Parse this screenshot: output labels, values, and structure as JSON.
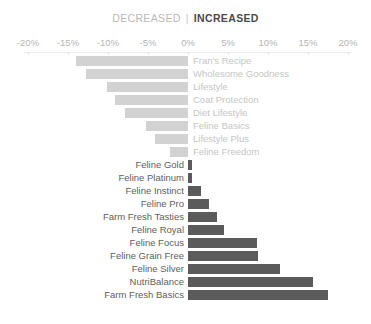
{
  "legend": {
    "decreased_label": "DECREASED",
    "separator": "|",
    "increased_label": "INCREASED"
  },
  "colors": {
    "decreased_bar": "#d2d2d2",
    "increased_bar": "#5b5b5b",
    "decreased_text": "#c6c6c6",
    "increased_text": "#5e5e5e",
    "axis_text": "#b5b5b5",
    "axis_line": "#ededed",
    "background": "#ffffff"
  },
  "chart_data": {
    "type": "bar",
    "orientation": "horizontal",
    "title": "",
    "subtitle": "",
    "xlabel": "",
    "ylabel": "",
    "xlim": [
      -20,
      20
    ],
    "xticks": [
      -20,
      -15,
      -10,
      -5,
      0,
      5,
      10,
      15,
      20
    ],
    "xtick_labels": [
      "-20%",
      "-15%",
      "-10%",
      "-5%",
      "0%",
      "5%",
      "10%",
      "15%",
      "20%"
    ],
    "grid": false,
    "legend_position": "top-center",
    "legend_entries": [
      "DECREASED",
      "INCREASED"
    ],
    "categories": [
      "Fran's Recipe",
      "Wholesome Goodness",
      "Lifestyle",
      "Coat Protection",
      "Diet Lifestyle",
      "Feline Basics",
      "Lifestyle Plus",
      "Feline Freedom",
      "Feline Gold",
      "Feline Platinum",
      "Feline Instinct",
      "Feline Pro",
      "Farm Fresh Tasties",
      "Feline Royal",
      "Feline Focus",
      "Feline Grain Free",
      "Feline Silver",
      "NutriBalance",
      "Farm Fresh Basics"
    ],
    "values": [
      -14.0,
      -12.8,
      -10.1,
      -9.1,
      -7.9,
      -5.3,
      -4.1,
      -2.3,
      0.5,
      0.5,
      1.6,
      2.6,
      3.6,
      4.5,
      8.6,
      8.8,
      11.5,
      15.6,
      17.5
    ],
    "bars": [
      {
        "label": "Fran's Recipe",
        "value": -14.0,
        "direction": "decreased"
      },
      {
        "label": "Wholesome Goodness",
        "value": -12.8,
        "direction": "decreased"
      },
      {
        "label": "Lifestyle",
        "value": -10.1,
        "direction": "decreased"
      },
      {
        "label": "Coat Protection",
        "value": -9.1,
        "direction": "decreased"
      },
      {
        "label": "Diet Lifestyle",
        "value": -7.9,
        "direction": "decreased"
      },
      {
        "label": "Feline Basics",
        "value": -5.3,
        "direction": "decreased"
      },
      {
        "label": "Lifestyle Plus",
        "value": -4.1,
        "direction": "decreased"
      },
      {
        "label": "Feline Freedom",
        "value": -2.3,
        "direction": "decreased"
      },
      {
        "label": "Feline Gold",
        "value": 0.5,
        "direction": "increased"
      },
      {
        "label": "Feline Platinum",
        "value": 0.5,
        "direction": "increased"
      },
      {
        "label": "Feline Instinct",
        "value": 1.6,
        "direction": "increased"
      },
      {
        "label": "Feline Pro",
        "value": 2.6,
        "direction": "increased"
      },
      {
        "label": "Farm Fresh Tasties",
        "value": 3.6,
        "direction": "increased"
      },
      {
        "label": "Feline Royal",
        "value": 4.5,
        "direction": "increased"
      },
      {
        "label": "Feline Focus",
        "value": 8.6,
        "direction": "increased"
      },
      {
        "label": "Feline Grain Free",
        "value": 8.8,
        "direction": "increased"
      },
      {
        "label": "Feline Silver",
        "value": 11.5,
        "direction": "increased"
      },
      {
        "label": "NutriBalance",
        "value": 15.6,
        "direction": "increased"
      },
      {
        "label": "Farm Fresh Basics",
        "value": 17.5,
        "direction": "increased"
      }
    ]
  }
}
